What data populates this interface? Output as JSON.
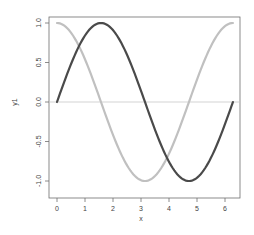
{
  "chart_data": {
    "type": "line",
    "title": "",
    "xlabel": "x",
    "ylabel": "y1",
    "xlim": [
      -0.25,
      6.53
    ],
    "ylim": [
      -1.08,
      1.08
    ],
    "grid": false,
    "legend": null,
    "x_ticks": [
      0,
      1,
      2,
      3,
      4,
      5,
      6
    ],
    "x_tick_labels": [
      "0",
      "1",
      "2",
      "3",
      "4",
      "5",
      "6"
    ],
    "y_ticks": [
      -1.0,
      -0.5,
      0.0,
      0.5,
      1.0
    ],
    "y_tick_labels": [
      "-1.0",
      "-0.5",
      "0.0",
      "0.5",
      "1.0"
    ],
    "reference_line": {
      "y": 0,
      "color": "#c8c8c8"
    },
    "series": [
      {
        "name": "sin(x)",
        "color": "#4a4a4a",
        "x_range": [
          0,
          6.283
        ],
        "function": "sin",
        "x": [
          0,
          0.785,
          1.571,
          2.356,
          3.142,
          3.927,
          4.712,
          5.498,
          6.283
        ],
        "values": [
          0,
          0.71,
          1.0,
          0.71,
          0,
          -0.71,
          -1.0,
          -0.71,
          0
        ]
      },
      {
        "name": "cos(x)",
        "color": "#c0c0c0",
        "x_range": [
          0,
          6.283
        ],
        "function": "cos",
        "x": [
          0,
          0.785,
          1.571,
          2.356,
          3.142,
          3.927,
          4.712,
          5.498,
          6.283
        ],
        "values": [
          1.0,
          0.71,
          0,
          -0.71,
          -1.0,
          -0.71,
          0,
          0.71,
          1.0
        ]
      }
    ]
  },
  "axes": {
    "x_title": "x",
    "y_title": "y1"
  }
}
